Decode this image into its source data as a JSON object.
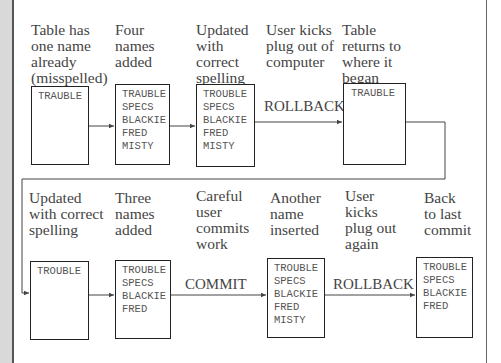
{
  "row1": {
    "steps": [
      {
        "label": "Table has\none name\nalready\n(misspelled)",
        "names": [
          "TRAUBLE"
        ]
      },
      {
        "label": "Four\nnames\nadded",
        "names": [
          "TRAUBLE",
          "SPECS",
          "BLACKIE",
          "FRED",
          "MISTY"
        ]
      },
      {
        "label": "Updated\nwith\ncorrect\nspelling",
        "names": [
          "TROUBLE",
          "SPECS",
          "BLACKIE",
          "FRED",
          "MISTY"
        ]
      },
      {
        "label": "User kicks\nplug out of\ncomputer",
        "operation": "ROLLBACK"
      },
      {
        "label": "Table\nreturns to\nwhere it\nbegan",
        "names": [
          "TRAUBLE"
        ]
      }
    ]
  },
  "row2": {
    "steps": [
      {
        "label": "Updated\nwith correct\nspelling",
        "names": [
          "TROUBLE"
        ]
      },
      {
        "label": "Three\nnames\nadded",
        "names": [
          "TROUBLE",
          "SPECS",
          "BLACKIE",
          "FRED"
        ]
      },
      {
        "label": "Careful\nuser\ncommits\nwork",
        "operation": "COMMIT"
      },
      {
        "label": "Another\nname\ninserted",
        "names": [
          "TROUBLE",
          "SPECS",
          "BLACKIE",
          "FRED",
          "MISTY"
        ]
      },
      {
        "label": "User\nkicks\nplug out\nagain",
        "operation": "ROLLBACK"
      },
      {
        "label": "Back\nto last\ncommit",
        "names": [
          "TROUBLE",
          "SPECS",
          "BLACKIE",
          "FRED"
        ]
      }
    ]
  }
}
